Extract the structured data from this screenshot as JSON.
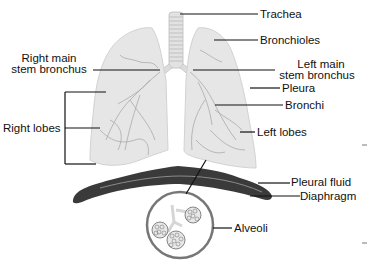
{
  "diagram": {
    "labels": {
      "trachea": "Trachea",
      "bronchioles": "Bronchioles",
      "right_main_line1": "Right main",
      "right_main_line2": "stem bronchus",
      "left_main_line1": "Left main",
      "left_main_line2": "stem bronchus",
      "pleura": "Pleura",
      "bronchi": "Bronchi",
      "right_lobes": "Right lobes",
      "left_lobes": "Left lobes",
      "pleural_fluid": "Pleural fluid",
      "diaphragm": "Diaphragm",
      "alveoli": "Alveoli"
    },
    "colors": {
      "lung_fill": "#e6e6e6",
      "lung_vessels": "#a8a8a8",
      "diaphragm": "#3a3a3a",
      "leader_lines": "#111111",
      "circle_border": "#777777"
    }
  }
}
